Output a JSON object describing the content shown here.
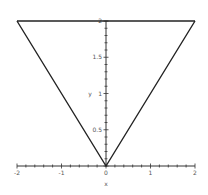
{
  "chart_data": {
    "type": "line",
    "title": "",
    "xlabel": "x",
    "ylabel": "y",
    "xlim": [
      -2,
      2
    ],
    "ylim": [
      0,
      2
    ],
    "grid": false,
    "legend": null,
    "x_ticks": [
      "-2",
      "-1",
      "0",
      "1",
      "2"
    ],
    "y_ticks": [
      "0.5",
      "1",
      "1.5",
      "2"
    ],
    "series": [
      {
        "name": "V-shape (|x|)",
        "x": [
          -2,
          0,
          2
        ],
        "y": [
          2,
          0,
          2
        ]
      },
      {
        "name": "y = 2",
        "x": [
          -2,
          2
        ],
        "y": [
          2,
          2
        ]
      }
    ]
  },
  "colors": {
    "line": "#222222",
    "axis": "#333333",
    "text": "#555555"
  }
}
